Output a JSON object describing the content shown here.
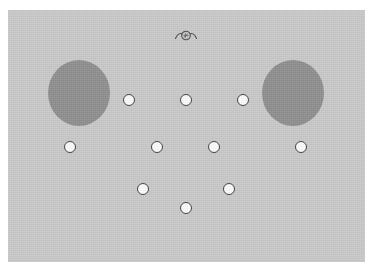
{
  "figure": {
    "panel": {
      "background_color": "#c9c9c9",
      "x": 8,
      "y": 10,
      "width": 357,
      "height": 252
    },
    "page_background_color": "#ffffff"
  },
  "blobs": {
    "fill_color": "#8f8f8f",
    "items": [
      {
        "name": "left-blob",
        "cx": 79,
        "cy": 93,
        "rx": 31,
        "ry": 33
      },
      {
        "name": "right-blob",
        "cx": 293,
        "cy": 93,
        "rx": 31,
        "ry": 33
      }
    ]
  },
  "nodes": {
    "fill_color": "#fbfbfb",
    "stroke_color": "#404040",
    "diameter": 12,
    "count": 10,
    "rows": [
      {
        "label": "row-1",
        "cy": 100,
        "items": [
          {
            "name": "node-1",
            "cx": 129,
            "cy": 100
          },
          {
            "name": "node-2",
            "cx": 186,
            "cy": 100
          },
          {
            "name": "node-3",
            "cx": 243,
            "cy": 100
          }
        ]
      },
      {
        "label": "row-2",
        "cy": 147,
        "items": [
          {
            "name": "node-4",
            "cx": 70,
            "cy": 147
          },
          {
            "name": "node-5",
            "cx": 157,
            "cy": 147
          },
          {
            "name": "node-6",
            "cx": 214,
            "cy": 147
          },
          {
            "name": "node-7",
            "cx": 301,
            "cy": 147
          }
        ]
      },
      {
        "label": "row-3",
        "cy": 189,
        "items": [
          {
            "name": "node-8",
            "cx": 143,
            "cy": 189
          },
          {
            "name": "node-9",
            "cx": 229,
            "cy": 189
          }
        ]
      },
      {
        "label": "row-4",
        "cy": 208,
        "items": [
          {
            "name": "node-10",
            "cx": 186,
            "cy": 208
          }
        ]
      }
    ]
  },
  "marker": {
    "name": "winged-circle-marker",
    "cx": 186,
    "cy": 35,
    "radius": 4.5,
    "stroke_color": "#4a4a4a",
    "description": "small circle flanked by curved wing strokes"
  }
}
